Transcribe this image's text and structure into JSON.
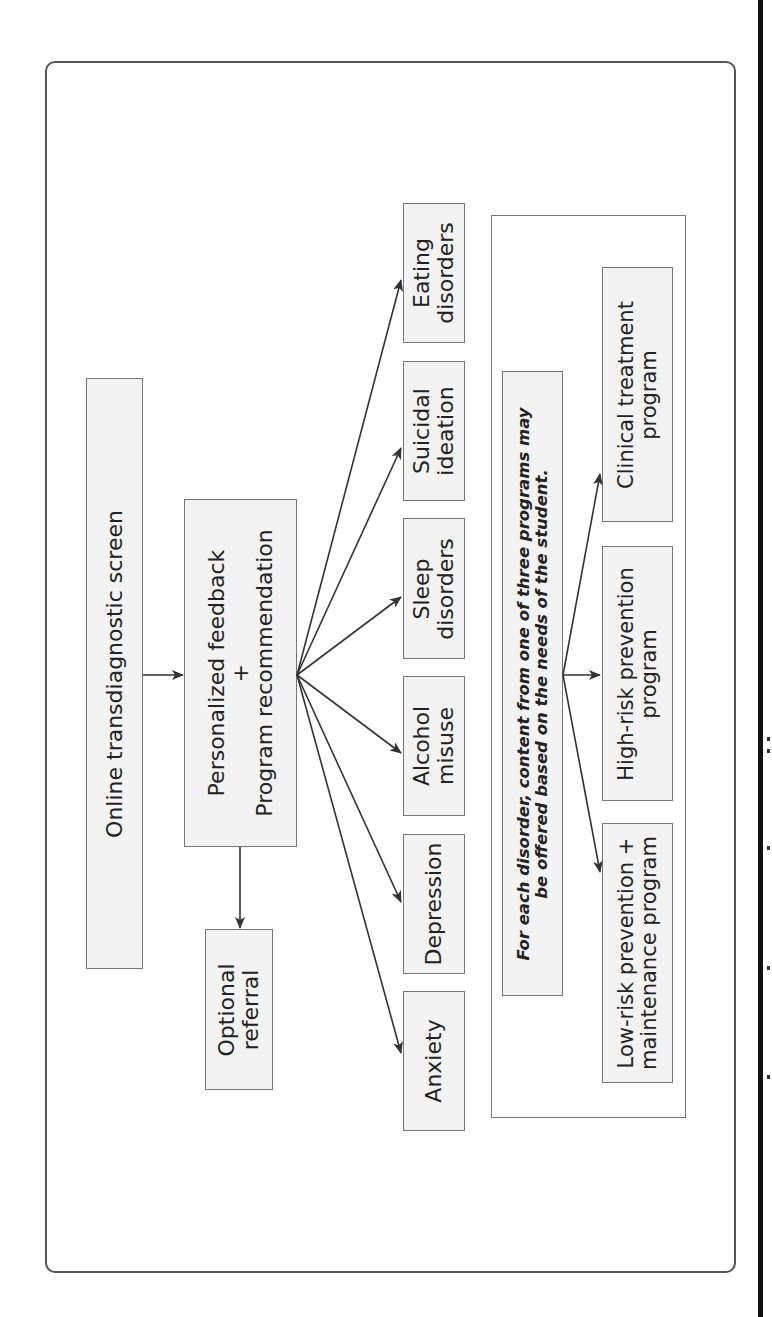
{
  "diagram": {
    "orientation": "rotated-90-ccw",
    "start_node": {
      "label": "Online transdiagnostic screen"
    },
    "feedback_node": {
      "line1": "Personalized feedback",
      "line2": "+",
      "line3": "Program recommendation"
    },
    "referral_node": {
      "line1": "Optional",
      "line2": "referral"
    },
    "disorders": [
      {
        "line1": "Eating",
        "line2": "disorders"
      },
      {
        "line1": "Suicidal",
        "line2": "ideation"
      },
      {
        "line1": "Sleep",
        "line2": "disorders"
      },
      {
        "line1": "Alcohol",
        "line2": "misuse"
      },
      {
        "line1": "Depression",
        "line2": ""
      },
      {
        "line1": "Anxiety",
        "line2": ""
      }
    ],
    "note": {
      "line1": "For each disorder, content from one of three programs may",
      "line2": "be offered based on the needs of the student."
    },
    "programs": [
      {
        "line1": "Clinical treatment",
        "line2": "program"
      },
      {
        "line1": "High-risk prevention",
        "line2": "program"
      },
      {
        "line1": "Low-risk prevention +",
        "line2": "maintenance program"
      }
    ],
    "colors": {
      "box_fill": "#f3f3f3",
      "box_border": "#777777",
      "arrow": "#333333",
      "frame": "#555555"
    }
  }
}
